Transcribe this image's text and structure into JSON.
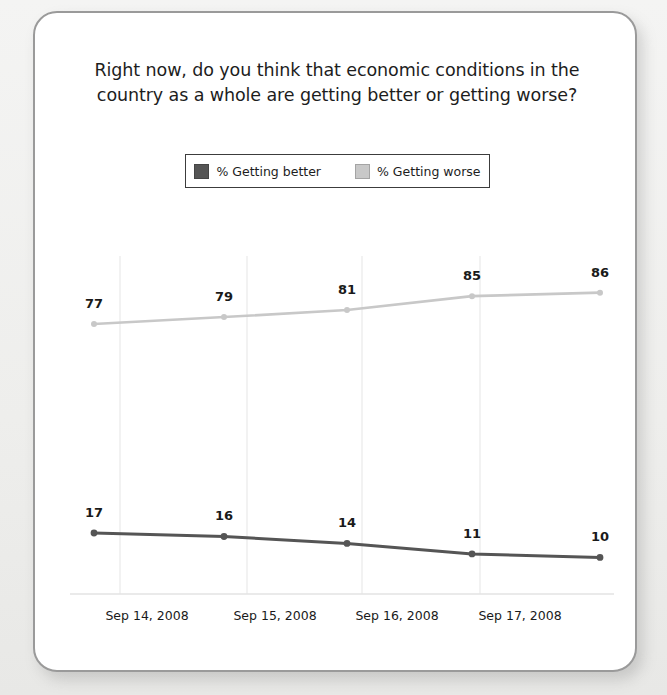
{
  "card": {
    "title_line1": "Right now, do you think that economic conditions in the",
    "title_line2": "country as a whole are getting better or getting worse?"
  },
  "legend": {
    "entries": [
      {
        "label": "% Getting better",
        "color": "#555555",
        "icon": "legend-swatch-icon"
      },
      {
        "label": "% Getting worse",
        "color": "#c8c8c8",
        "icon": "legend-swatch-icon"
      }
    ]
  },
  "chart_data": {
    "type": "line",
    "title": "Right now, do you think that economic conditions in the country as a whole are getting better or getting worse?",
    "xlabel": "",
    "ylabel": "",
    "ylim": [
      0,
      100
    ],
    "grid": "vertical",
    "legend_position": "top-center",
    "categories": [
      "Sep 14, 2008",
      "Sep 15, 2008",
      "Sep 16, 2008",
      "Sep 17, 2008",
      ""
    ],
    "tick_labels": [
      "Sep 14, 2008",
      "Sep 15, 2008",
      "Sep 16, 2008",
      "Sep 17, 2008"
    ],
    "series": [
      {
        "name": "% Getting worse",
        "color": "#c8c8c8",
        "values": [
          77,
          79,
          81,
          85,
          86
        ]
      },
      {
        "name": "% Getting better",
        "color": "#555555",
        "values": [
          17,
          16,
          14,
          11,
          10
        ]
      }
    ]
  }
}
